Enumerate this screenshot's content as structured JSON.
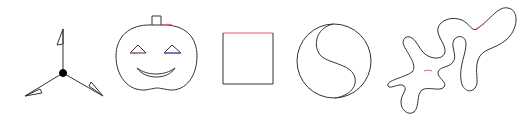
{
  "canvas": {
    "width": 525,
    "height": 120,
    "background": "#ffffff"
  },
  "colors": {
    "stroke": "#333333",
    "accent_red": "#e05a6a",
    "accent_blue": "#4a5fc8",
    "fill_dot": "#000000"
  },
  "shapes": [
    {
      "id": "tri-spoke",
      "label": "three-spoke figure with triangle flags"
    },
    {
      "id": "pumpkin",
      "label": "jack-o-lantern face"
    },
    {
      "id": "square",
      "label": "square with red top edge"
    },
    {
      "id": "yin-yang",
      "label": "circle divided by S-curve"
    },
    {
      "id": "blob",
      "label": "organic blob shape"
    }
  ]
}
